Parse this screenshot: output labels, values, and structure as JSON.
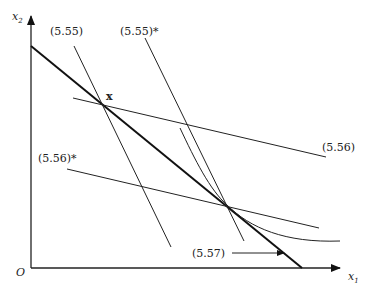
{
  "figure": {
    "axes": {
      "x_label": "x",
      "x_sub": "1",
      "y_label": "x",
      "y_sub": "2",
      "origin_label": "O"
    },
    "point_label": "x",
    "labels": {
      "c555": "(5.55)",
      "c555s": "(5.55)*",
      "c556": "(5.56)",
      "c556s": "(5.56)*",
      "c557": "(5.57)"
    },
    "colors": {
      "ink": "#222222",
      "background": "#ffffff"
    }
  }
}
